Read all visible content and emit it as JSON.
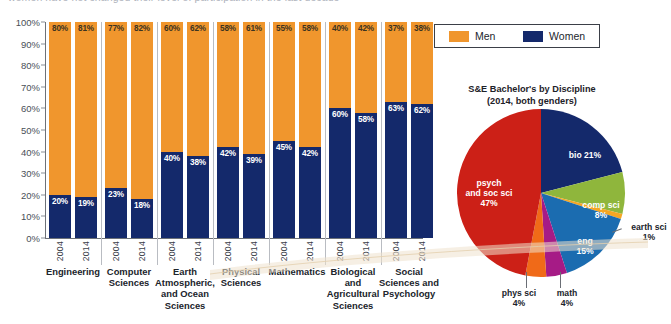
{
  "headline": "women have not changed their level of participation in the last decade",
  "colors": {
    "men": "#f0962d",
    "women": "#14296b",
    "bio": "#14296b",
    "comp_sci": "#8fb63c",
    "earth_sci": "#f5a623",
    "eng": "#1b6cb0",
    "math": "#a61b86",
    "phys_sci": "#f06a18",
    "psych_soc": "#cc2017"
  },
  "legend": {
    "items": [
      {
        "label": "Men",
        "swatch": "men-swatch"
      },
      {
        "label": "Women",
        "swatch": "women-swatch"
      }
    ]
  },
  "chart_data": [
    {
      "type": "bar",
      "title": "",
      "xlabel": "",
      "ylabel": "",
      "ylim": [
        0,
        100
      ],
      "grid": false,
      "stacked": true,
      "legend_position": "top-right",
      "yticks": [
        "0%",
        "10%",
        "20%",
        "30%",
        "40%",
        "50%",
        "60%",
        "70%",
        "80%",
        "90%",
        "100%"
      ],
      "categories": [
        "Engineering",
        "Computer Sciences",
        "Earth, Atmospheric, and Ocean Sciences",
        "Physical Sciences",
        "Mathematics",
        "Biological and Agricultural Sciences",
        "Social Sciences and Psychology"
      ],
      "years": [
        "2004",
        "2014"
      ],
      "series": [
        {
          "name": "Men",
          "values": [
            80,
            81,
            77,
            82,
            60,
            62,
            58,
            61,
            55,
            58,
            40,
            42,
            37,
            38
          ]
        },
        {
          "name": "Women",
          "values": [
            20,
            19,
            23,
            18,
            40,
            38,
            42,
            39,
            45,
            42,
            60,
            58,
            63,
            62
          ]
        }
      ],
      "groups": [
        {
          "category": "Engineering",
          "lines": [
            "Engineering"
          ],
          "bars": [
            {
              "year": "2004",
              "men": 80,
              "women": 20
            },
            {
              "year": "2014",
              "men": 81,
              "women": 19
            }
          ]
        },
        {
          "category": "Computer Sciences",
          "lines": [
            "Computer",
            "Sciences"
          ],
          "bars": [
            {
              "year": "2004",
              "men": 77,
              "women": 23
            },
            {
              "year": "2014",
              "men": 82,
              "women": 18
            }
          ]
        },
        {
          "category": "Earth, Atmospheric, and Ocean Sciences",
          "lines": [
            "Earth",
            "Atmospheric,",
            "and Ocean",
            "Sciences"
          ],
          "bars": [
            {
              "year": "2004",
              "men": 60,
              "women": 40
            },
            {
              "year": "2014",
              "men": 62,
              "women": 38
            }
          ]
        },
        {
          "category": "Physical Sciences",
          "lines": [
            "Physical",
            "Sciences"
          ],
          "bars": [
            {
              "year": "2004",
              "men": 58,
              "women": 42
            },
            {
              "year": "2014",
              "men": 61,
              "women": 39
            }
          ]
        },
        {
          "category": "Mathematics",
          "lines": [
            "Mathematics"
          ],
          "bars": [
            {
              "year": "2004",
              "men": 55,
              "women": 45
            },
            {
              "year": "2014",
              "men": 58,
              "women": 42
            }
          ]
        },
        {
          "category": "Biological and Agricultural Sciences",
          "lines": [
            "Biological",
            "and",
            "Agricultural",
            "Sciences"
          ],
          "bars": [
            {
              "year": "2004",
              "men": 40,
              "women": 60
            },
            {
              "year": "2014",
              "men": 42,
              "women": 58
            }
          ]
        },
        {
          "category": "Social Sciences and Psychology",
          "lines": [
            "Social",
            "Sciences and",
            "Psychology"
          ],
          "bars": [
            {
              "year": "2004",
              "men": 37,
              "women": 63
            },
            {
              "year": "2014",
              "men": 38,
              "women": 62
            }
          ]
        }
      ]
    },
    {
      "type": "pie",
      "title": "S&E Bachelor's by Discipline",
      "subtitle": "(2014, both genders)",
      "legend_position": "none",
      "labels": [
        "bio",
        "comp sci",
        "earth sci",
        "eng",
        "math",
        "phys sci",
        "psych and soc sci"
      ],
      "values": [
        21,
        8,
        1,
        15,
        4,
        4,
        47
      ],
      "slices": [
        {
          "name": "bio",
          "label_line1": "bio 21%",
          "label_line2": "",
          "value": 21,
          "color": "#14296b"
        },
        {
          "name": "comp sci",
          "label_line1": "comp sci",
          "label_line2": "8%",
          "value": 8,
          "color": "#8fb63c"
        },
        {
          "name": "earth sci",
          "label_line1": "earth sci",
          "label_line2": "1%",
          "value": 1,
          "color": "#f5a623"
        },
        {
          "name": "eng",
          "label_line1": "eng",
          "label_line2": "15%",
          "value": 15,
          "color": "#1b6cb0"
        },
        {
          "name": "math",
          "label_line1": "math",
          "label_line2": "4%",
          "value": 4,
          "color": "#a61b86"
        },
        {
          "name": "phys sci",
          "label_line1": "phys sci",
          "label_line2": "4%",
          "value": 4,
          "color": "#f06a18"
        },
        {
          "name": "psych and soc sci",
          "label_line1": "psych",
          "label_line2": "and soc sci",
          "label_line3": "47%",
          "value": 47,
          "color": "#cc2017"
        }
      ]
    }
  ]
}
